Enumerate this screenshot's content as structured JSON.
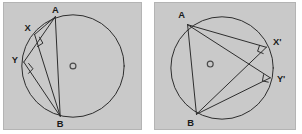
{
  "image": {
    "kind": "geometry-diagram-pair",
    "description": "Two circle diagrams illustrating angles subtended by a chord AB at points on the major arc",
    "background_color": "#ffffff",
    "panel_fill": "#c9c9c9",
    "panel_border": "#b4b4b4",
    "stroke_color": "#2b2b2b",
    "label_color": "#1a1a1a"
  },
  "figures": [
    {
      "id": "left",
      "name": "circle-diagram-left",
      "circle": {
        "cx": 70,
        "cy": 64,
        "r": 52
      },
      "center_marker": {
        "label": "o",
        "cx": 70,
        "cy": 64,
        "r": 3
      },
      "points": [
        {
          "label": "A",
          "x": 52,
          "y": 14,
          "label_x": 52,
          "label_y": 8
        },
        {
          "label": "B",
          "x": 57,
          "y": 115,
          "label_x": 57,
          "label_y": 127
        },
        {
          "label": "X",
          "x": 31,
          "y": 32,
          "label_x": 23,
          "label_y": 28
        },
        {
          "label": "Y",
          "x": 20,
          "y": 60,
          "label_x": 11,
          "label_y": 58
        }
      ],
      "segments": [
        {
          "from": "A",
          "to": "X"
        },
        {
          "from": "X",
          "to": "B"
        },
        {
          "from": "A",
          "to": "Y"
        },
        {
          "from": "Y",
          "to": "B"
        },
        {
          "from": "A",
          "to": "B"
        }
      ],
      "right_angles": [
        "X",
        "Y"
      ]
    },
    {
      "id": "right",
      "name": "circle-diagram-right",
      "circle": {
        "cx": 68,
        "cy": 66,
        "r": 52
      },
      "center_marker": {
        "label": "o",
        "cx": 56,
        "cy": 62,
        "r": 3
      },
      "points": [
        {
          "label": "A",
          "x": 33,
          "y": 22,
          "label_x": 26,
          "label_y": 15
        },
        {
          "label": "B",
          "x": 42,
          "y": 113,
          "label_x": 36,
          "label_y": 126
        },
        {
          "label": "X'",
          "x": 113,
          "y": 45,
          "label_x": 122,
          "label_y": 43
        },
        {
          "label": "Y'",
          "x": 117,
          "y": 76,
          "label_x": 125,
          "label_y": 78
        }
      ],
      "segments": [
        {
          "from": "A",
          "to": "X'"
        },
        {
          "from": "X'",
          "to": "B"
        },
        {
          "from": "A",
          "to": "Y'"
        },
        {
          "from": "Y'",
          "to": "B"
        },
        {
          "from": "A",
          "to": "B"
        }
      ],
      "right_angles": [
        "X'",
        "Y'"
      ]
    }
  ],
  "labels": {
    "left": {
      "a": "A",
      "b": "B",
      "x": "X",
      "y": "Y",
      "center": "o"
    },
    "right": {
      "a": "A",
      "b": "B",
      "x": "X'",
      "y": "Y'",
      "center": "o"
    }
  }
}
